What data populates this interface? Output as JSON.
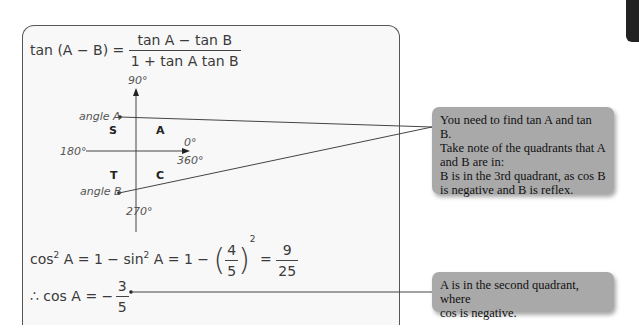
{
  "formula": {
    "lhs": "tan (A − B) =",
    "numerator": "tan A − tan B",
    "denominator": "1 + tan A tan B"
  },
  "diagram": {
    "axis_top": "90°",
    "axis_left": "180°",
    "axis_right_top": "0°",
    "axis_right_bottom": "360°",
    "axis_bottom": "270°",
    "angle_a_label": "angle A",
    "angle_b_label": "angle B",
    "quadrants": {
      "q1": "A",
      "q2": "S",
      "q3": "T",
      "q4": "C"
    }
  },
  "equation_cos2": {
    "lhs": "cos",
    "lhs_exp": "2",
    "lhs_var": "A = 1 − sin",
    "sin_exp": "2",
    "mid": "A = 1 −",
    "frac_num": "4",
    "frac_den": "5",
    "pow": "2",
    "eq": "=",
    "res_num": "9",
    "res_den": "25"
  },
  "equation_cosA": {
    "lhs": "∴ cos A = −",
    "num": "3",
    "den": "5"
  },
  "callouts": [
    {
      "lines": [
        "You need to find tan A and tan B.",
        "Take note of the quadrants that A",
        "and B are in:",
        "B is in the 3rd quadrant, as cos B",
        "is negative and B is reflex."
      ]
    },
    {
      "lines": [
        "A is in the second quadrant, where",
        "cos is negative."
      ]
    }
  ],
  "colors": {
    "callout_bg": "#a9a9a9",
    "panel_bg": "#f8f8f8",
    "tab": "#222222"
  }
}
